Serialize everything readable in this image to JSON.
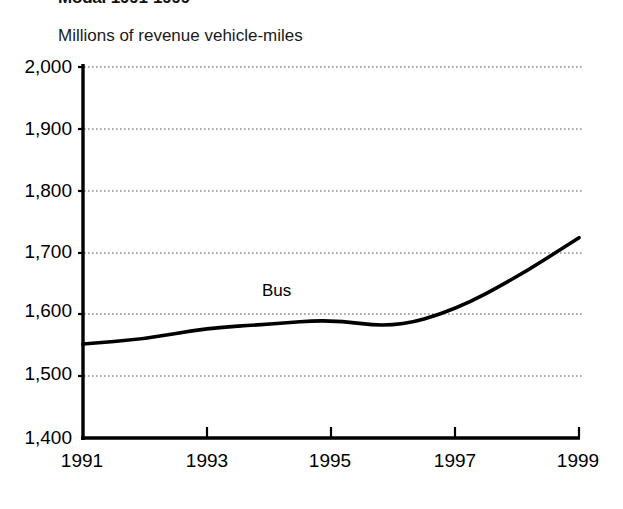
{
  "figure": {
    "title": "Modal 1991-1999",
    "title_truncated": true,
    "subtitle": "Millions of revenue vehicle-miles",
    "background_color": "#ffffff",
    "line_color": "#000000",
    "gridline_color": "#999999"
  },
  "chart_data": {
    "type": "line",
    "title": "Modal 1991-1999",
    "subtitle": "Millions of revenue vehicle-miles",
    "xlabel": "",
    "ylabel": "Millions of revenue vehicle-miles",
    "x": [
      1991,
      1992,
      1993,
      1994,
      1995,
      1996,
      1997,
      1998,
      1999
    ],
    "xlim": [
      1991,
      1999
    ],
    "ylim": [
      1400,
      2000
    ],
    "xticks": [
      1991,
      1993,
      1995,
      1997,
      1999
    ],
    "xtick_labels": [
      "1991",
      "1993",
      "1995",
      "1997",
      "1999"
    ],
    "yticks": [
      1400,
      1500,
      1600,
      1700,
      1800,
      1900,
      2000
    ],
    "ytick_labels": [
      "1,400",
      "1,500",
      "1,600",
      "1,700",
      "1,800",
      "1,900",
      "2,000"
    ],
    "grid": "horizontal-dotted",
    "legend": "inline-series-label",
    "series": [
      {
        "name": "Bus",
        "label": "Bus",
        "color": "#000000",
        "values": [
          1552,
          1560,
          1578,
          1584,
          1592,
          1578,
          1607,
          1660,
          1724
        ]
      }
    ],
    "annotations": [
      {
        "text": "Bus",
        "x": 1994.1,
        "y": 1645
      }
    ]
  },
  "axes": {
    "y_labels": [
      "2,000",
      "1,900",
      "1,800",
      "1,700",
      "1,600",
      "1,500",
      "1,400"
    ],
    "x_labels": [
      "1991",
      "1993",
      "1995",
      "1997",
      "1999"
    ]
  }
}
